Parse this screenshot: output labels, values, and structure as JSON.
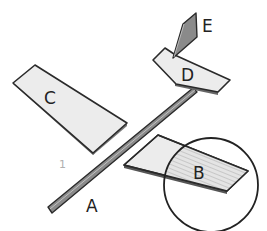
{
  "diagram": {
    "type": "assembly-parts",
    "parts": [
      {
        "id": "A",
        "label": "A",
        "description": "long thin rod / fuselage spar"
      },
      {
        "id": "B",
        "label": "B",
        "description": "wing panel with ribbed detail, highlighted by circle"
      },
      {
        "id": "C",
        "label": "C",
        "description": "wing panel"
      },
      {
        "id": "D",
        "label": "D",
        "description": "horizontal tail stabilizer"
      },
      {
        "id": "E",
        "label": "E",
        "description": "vertical tail fin"
      }
    ],
    "step_number": "1",
    "colors": {
      "panel_fill": "#ececec",
      "outline": "#2a2a2a",
      "rod_fill": "#8a8a8a",
      "fin_fill": "#8a8a8a",
      "step_number": "#b0b0b0"
    }
  }
}
